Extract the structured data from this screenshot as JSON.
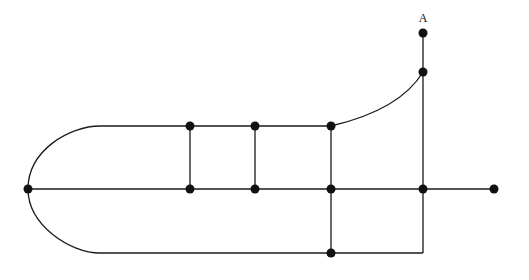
{
  "diagram": {
    "type": "graph",
    "labels": [
      {
        "id": "A",
        "text": "A",
        "node": "a"
      }
    ],
    "nodes": [
      "a",
      "n1",
      "p1",
      "p2",
      "p3",
      "q1",
      "q2",
      "q3",
      "left",
      "r1",
      "end",
      "b3"
    ],
    "edges": [
      {
        "from": "a",
        "to": "n1",
        "shape": "straight"
      },
      {
        "from": "n1",
        "to": "r1",
        "shape": "straight"
      },
      {
        "from": "n1",
        "to": "p3",
        "shape": "curve"
      },
      {
        "from": "p1",
        "to": "p2",
        "shape": "straight"
      },
      {
        "from": "p2",
        "to": "p3",
        "shape": "straight"
      },
      {
        "from": "p1",
        "to": "q1",
        "shape": "straight"
      },
      {
        "from": "p2",
        "to": "q2",
        "shape": "straight"
      },
      {
        "from": "p3",
        "to": "q3",
        "shape": "straight"
      },
      {
        "from": "q3",
        "to": "b3",
        "shape": "straight"
      },
      {
        "from": "left",
        "to": "q1",
        "shape": "straight"
      },
      {
        "from": "q1",
        "to": "q2",
        "shape": "straight"
      },
      {
        "from": "q2",
        "to": "q3",
        "shape": "straight"
      },
      {
        "from": "q3",
        "to": "r1",
        "shape": "straight"
      },
      {
        "from": "r1",
        "to": "end",
        "shape": "straight"
      },
      {
        "from": "left",
        "to": "p1",
        "shape": "curve"
      },
      {
        "from": "left",
        "to": "b3",
        "shape": "curve"
      },
      {
        "from": "r1",
        "to": "b3",
        "shape": "corner"
      }
    ]
  }
}
